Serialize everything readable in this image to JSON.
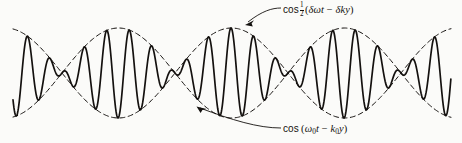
{
  "figure": {
    "title": "",
    "background_color": "#fbfbf9",
    "curve_color": "#14110f",
    "envelope_color": "#14110f"
  },
  "annotations": {
    "envelope_label": {
      "name": "envelope-label",
      "text": "cos ½(δωt − δky)",
      "function": "cos",
      "fraction_numerator": "1",
      "fraction_denominator": "2",
      "open_paren": "(",
      "term1": "δωt",
      "operator": "−",
      "term2": "δky",
      "close_paren": ")",
      "points_to": "envelope-curve"
    },
    "carrier_label": {
      "name": "carrier-label",
      "text": "cos (ω₀t − k₀y)",
      "function": "cos",
      "open_paren": "(",
      "term1_base": "ω",
      "term1_sub": "0",
      "term1_tail": "t",
      "operator": "−",
      "term2_base": "k",
      "term2_sub": "0",
      "term2_tail": "y",
      "close_paren": ")",
      "points_to": "carrier-curve"
    }
  },
  "chart_data": {
    "type": "line",
    "title": "",
    "xlabel": "",
    "ylabel": "",
    "grid": false,
    "legend": "none",
    "axes_visible": false,
    "xlim": [
      0,
      462
    ],
    "ylim": [
      143,
      0
    ],
    "baseline_y": 73,
    "amplitude_px": 45,
    "carrier_period_px": 22.6,
    "envelope_half_period_px": 113,
    "node_positions_x": [
      62,
      175,
      290,
      400
    ],
    "antinode_positions_x": [
      118,
      233,
      345
    ],
    "envelope_peak_y": 28,
    "envelope_trough_y": 118,
    "x_start": 13,
    "x_end": 451,
    "series": [
      {
        "name": "cos (ω₀t − k₀y)",
        "style": "solid",
        "linewidth": 1.6,
        "role": "carrier",
        "formula": "cos(0.2779*x - 0.2463) * cos(0.0278*x + 0.2795)"
      },
      {
        "name": "cos ½(δωt − δky) upper envelope",
        "style": "dashed",
        "linewidth": 1.0,
        "role": "envelope-upper",
        "formula": "+cos(0.0278*x + 0.2795)"
      },
      {
        "name": "cos ½(δωt − δky) lower envelope",
        "style": "dashed",
        "linewidth": 1.0,
        "role": "envelope-lower",
        "formula": "-cos(0.0278*x + 0.2795)"
      }
    ]
  }
}
